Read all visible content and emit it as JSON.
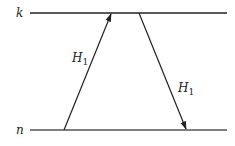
{
  "diagram": {
    "levels": [
      {
        "id": "k",
        "label": "k",
        "y": 13
      },
      {
        "id": "n",
        "label": "n",
        "y": 130
      }
    ],
    "transitions": [
      {
        "id": "up",
        "from": "n",
        "to": "k",
        "label": "H",
        "subscript": "1",
        "direction": "up"
      },
      {
        "id": "down",
        "from": "k",
        "to": "n",
        "label": "H",
        "subscript": "1",
        "direction": "down"
      }
    ],
    "colors": {
      "line": "#222222",
      "background": "#ffffff"
    }
  }
}
